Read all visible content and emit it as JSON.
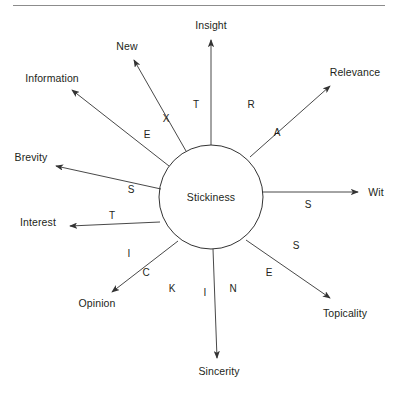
{
  "figure": {
    "title_rule": true,
    "center": {
      "label": "Stickiness",
      "cx": 211,
      "cy": 197,
      "r": 52
    },
    "stroke_color": "#333333",
    "rule_color": "#8c8c8c",
    "text_color": "#231f20",
    "background": "#ffffff"
  },
  "spokes": [
    {
      "id": "insight",
      "label": "Insight",
      "letter": "T",
      "angle_deg": 90,
      "label_x": 211,
      "label_y": 25,
      "label_anchor": "center",
      "letter_x": 196,
      "letter_y": 104,
      "x1": 211,
      "y1": 145,
      "x2": 211,
      "y2": 40
    },
    {
      "id": "new",
      "label": "New",
      "letter": "X",
      "angle_deg": 118,
      "label_x": 127,
      "label_y": 46,
      "label_anchor": "center",
      "letter_x": 166,
      "letter_y": 118,
      "x1": 186,
      "y1": 151,
      "x2": 134,
      "y2": 60
    },
    {
      "id": "information",
      "label": "Information",
      "letter": "E",
      "angle_deg": 143,
      "label_x": 52,
      "label_y": 78,
      "label_anchor": "center",
      "letter_x": 147,
      "letter_y": 134,
      "x1": 169,
      "y1": 166,
      "x2": 72,
      "y2": 90
    },
    {
      "id": "brevity",
      "label": "Brevity",
      "letter": "S",
      "angle_deg": 166,
      "label_x": 31,
      "label_y": 157,
      "label_anchor": "center",
      "letter_x": 131,
      "letter_y": 189,
      "x1": 161,
      "y1": 189,
      "x2": 56,
      "y2": 166
    },
    {
      "id": "interest",
      "label": "Interest",
      "letter": "T",
      "angle_deg": 182,
      "label_x": 38,
      "label_y": 222,
      "label_anchor": "center",
      "letter_x": 112,
      "letter_y": 215,
      "x1": 160,
      "y1": 222,
      "x2": 70,
      "y2": 226
    },
    {
      "id": "opinion",
      "label": "Opinion",
      "letter": "I",
      "letter2": "C",
      "angle_deg": 215,
      "label_x": 97,
      "label_y": 303,
      "label_anchor": "center",
      "letter_x": 129,
      "letter_y": 253,
      "letter2_x": 146,
      "letter2_y": 272,
      "x1": 178,
      "y1": 241,
      "x2": 112,
      "y2": 292
    },
    {
      "id": "sincerity",
      "label": "Sincerity",
      "letter": "K",
      "letter2": "I",
      "letter3": "N",
      "angle_deg": 270,
      "label_x": 219,
      "label_y": 371,
      "label_anchor": "center",
      "letter_x": 172,
      "letter_y": 288,
      "letter2_x": 205,
      "letter2_y": 292,
      "letter3_x": 233,
      "letter3_y": 288,
      "x1": 213,
      "y1": 249,
      "x2": 217,
      "y2": 358
    },
    {
      "id": "topicality",
      "label": "Topicality",
      "letter": "E",
      "letter2": "S",
      "angle_deg": 315,
      "label_x": 345,
      "label_y": 313,
      "label_anchor": "center",
      "letter_x": 269,
      "letter_y": 272,
      "letter2_x": 296,
      "letter2_y": 245,
      "x1": 246,
      "y1": 240,
      "x2": 330,
      "y2": 298
    },
    {
      "id": "wit",
      "label": "Wit",
      "letter": "S",
      "angle_deg": 0,
      "label_x": 376,
      "label_y": 192,
      "label_anchor": "center",
      "letter_x": 308,
      "letter_y": 204,
      "x1": 262,
      "y1": 192,
      "x2": 358,
      "y2": 192
    },
    {
      "id": "relevance",
      "label": "Relevance",
      "letter": "A",
      "letter2": "R",
      "angle_deg": 42,
      "label_x": 355,
      "label_y": 72,
      "label_anchor": "center",
      "letter_x": 277,
      "letter_y": 132,
      "letter2_x": 251,
      "letter2_y": 104,
      "x1": 250,
      "y1": 157,
      "x2": 330,
      "y2": 86
    }
  ]
}
